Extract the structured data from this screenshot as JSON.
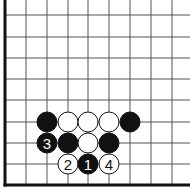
{
  "board": {
    "title": "Go problem diagram (lower-left corner)",
    "grid": {
      "x_lines": [
        5,
        26,
        47,
        68,
        88,
        109,
        130,
        151,
        172
      ],
      "y_lines": [
        15,
        37,
        58,
        79,
        100,
        122,
        143,
        164,
        185
      ],
      "right_extent": 190,
      "top_extent": 0,
      "edges": [
        "left",
        "bottom"
      ],
      "line_color": "#555555",
      "edge_color": "#111111"
    },
    "stone_radius": 10,
    "colors": {
      "black": "#111111",
      "white": "#ffffff",
      "stroke": "#111111"
    },
    "stones": [
      {
        "col": 2,
        "row": 5,
        "color": "black",
        "label": ""
      },
      {
        "col": 3,
        "row": 5,
        "color": "white",
        "label": ""
      },
      {
        "col": 4,
        "row": 5,
        "color": "white",
        "label": ""
      },
      {
        "col": 5,
        "row": 5,
        "color": "white",
        "label": ""
      },
      {
        "col": 6,
        "row": 5,
        "color": "black",
        "label": ""
      },
      {
        "col": 2,
        "row": 6,
        "color": "black",
        "label": "3"
      },
      {
        "col": 3,
        "row": 6,
        "color": "black",
        "label": ""
      },
      {
        "col": 4,
        "row": 6,
        "color": "white",
        "label": ""
      },
      {
        "col": 5,
        "row": 6,
        "color": "black",
        "label": ""
      },
      {
        "col": 3,
        "row": 7,
        "color": "white",
        "label": "2"
      },
      {
        "col": 4,
        "row": 7,
        "color": "black",
        "label": "1"
      },
      {
        "col": 5,
        "row": 7,
        "color": "white",
        "label": "4"
      }
    ]
  }
}
